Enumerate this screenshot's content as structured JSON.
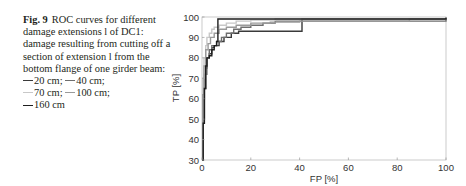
{
  "caption": {
    "fig_label": "Fig. 9",
    "text": "ROC curves for different damage extensions l of DC1: damage resulting from cutting off a section of extension l from the bottom flange of one girder beam:",
    "legend": [
      {
        "label": "20 cm;",
        "color": "#3a3a3a"
      },
      {
        "label": "40 cm;",
        "color": "#6e6e6e"
      },
      {
        "label": "70 cm;",
        "color": "#c8c8c8"
      },
      {
        "label": "100 cm;",
        "color": "#9a9a9a"
      },
      {
        "label": "160 cm",
        "color": "#1e1e1e"
      }
    ]
  },
  "chart_data": {
    "type": "line",
    "title": "",
    "xlabel": "FP [%]",
    "ylabel": "TP [%]",
    "xlim": [
      0,
      100
    ],
    "ylim": [
      30,
      100
    ],
    "xticks": [
      0,
      20,
      40,
      60,
      80,
      100
    ],
    "yticks": [
      30,
      40,
      50,
      60,
      70,
      80,
      90,
      100
    ],
    "grid": false,
    "legend_position": "caption",
    "series": [
      {
        "name": "20 cm",
        "color": "#3a3a3a",
        "x": [
          0,
          0.5,
          1,
          1.5,
          2,
          3,
          4,
          5,
          7,
          9,
          12,
          15,
          20,
          30,
          40,
          41,
          100
        ],
        "y": [
          0,
          50,
          65,
          75,
          80,
          82,
          85,
          86,
          88,
          90,
          92,
          93,
          93,
          93,
          93,
          99,
          100
        ]
      },
      {
        "name": "40 cm",
        "color": "#6e6e6e",
        "x": [
          0,
          0.5,
          1,
          2,
          3,
          4,
          6,
          8,
          10,
          13,
          16,
          20,
          25,
          30,
          100
        ],
        "y": [
          0,
          60,
          72,
          80,
          84,
          86,
          88,
          90,
          92,
          94,
          95,
          96,
          97,
          98,
          100
        ]
      },
      {
        "name": "70 cm",
        "color": "#c8c8c8",
        "x": [
          0,
          0.3,
          0.8,
          1.5,
          2,
          3,
          4,
          5,
          7,
          10,
          14,
          20,
          30,
          100
        ],
        "y": [
          0,
          70,
          80,
          86,
          90,
          92,
          94,
          95,
          96,
          97,
          98,
          98.5,
          99,
          100
        ]
      },
      {
        "name": "100 cm",
        "color": "#9a9a9a",
        "x": [
          0,
          0.3,
          0.8,
          1.5,
          2.5,
          3.5,
          5,
          7,
          10,
          14,
          20,
          28,
          40,
          85,
          100
        ],
        "y": [
          0,
          62,
          76,
          84,
          87,
          90,
          92,
          94,
          95,
          96,
          97,
          97.5,
          98,
          99,
          100
        ]
      },
      {
        "name": "160 cm",
        "color": "#1e1e1e",
        "x": [
          0,
          0.5,
          1,
          1.5,
          2,
          3,
          4,
          5,
          6,
          6.5,
          100
        ],
        "y": [
          0,
          48,
          65,
          76,
          80,
          81,
          84,
          86,
          88,
          99,
          99.5
        ]
      }
    ]
  }
}
